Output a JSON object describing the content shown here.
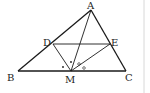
{
  "figure": {
    "type": "triangle-geometry",
    "points": {
      "A": {
        "label": "A",
        "x": 91,
        "y": 10
      },
      "B": {
        "label": "B",
        "x": 18,
        "y": 71
      },
      "C": {
        "label": "C",
        "x": 126,
        "y": 71
      },
      "D": {
        "label": "D",
        "x": 53,
        "y": 44
      },
      "E": {
        "label": "E",
        "x": 110,
        "y": 44
      },
      "M": {
        "label": "M",
        "x": 71,
        "y": 71
      }
    },
    "segments": [
      "AB",
      "BC",
      "CA",
      "DE",
      "DM",
      "EM",
      "AM"
    ],
    "angle_marks": [
      {
        "symbol": "•",
        "between": "MD-MA"
      },
      {
        "symbol": "•",
        "between": "MB-MD"
      },
      {
        "symbol": "°",
        "between": "MA-ME"
      },
      {
        "symbol": "°",
        "between": "ME-MC"
      }
    ],
    "line_color": "#1a1a1a",
    "border_color": "#d8d8d8"
  }
}
